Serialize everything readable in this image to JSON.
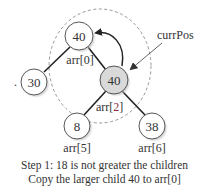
{
  "diagram": {
    "type": "heap-sift-down-step",
    "nodes": [
      {
        "id": "root",
        "value": "40",
        "index_label": "arr[0]",
        "highlighted": false
      },
      {
        "id": "left",
        "value": "30",
        "index_label": "",
        "highlighted": false
      },
      {
        "id": "right",
        "value": "40",
        "index_label_prefix": "arr[",
        "index_label_num": "2",
        "index_label_suffix": "]",
        "highlighted": true
      },
      {
        "id": "rl",
        "value": "8",
        "index_label": "arr[5]",
        "highlighted": false
      },
      {
        "id": "rr",
        "value": "38",
        "index_label": "arr[6]",
        "highlighted": false
      }
    ],
    "edges": [
      {
        "from": "root",
        "to": "left"
      },
      {
        "from": "root",
        "to": "right"
      },
      {
        "from": "right",
        "to": "rl"
      },
      {
        "from": "right",
        "to": "rr"
      }
    ],
    "pointer_label": "currPos",
    "stray_mark": ".",
    "colors": {
      "highlight_fill": "#d9d9d9",
      "node_fill": "#ffffff",
      "stroke": "#222222",
      "dashed": "#888888",
      "index_accent": "#8b2a3a"
    }
  },
  "caption": {
    "line1": "Step 1: 18 is not greater the children",
    "line2": "Copy the larger child 40 to arr[0]"
  }
}
